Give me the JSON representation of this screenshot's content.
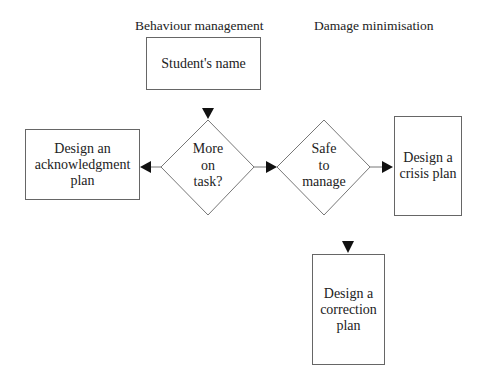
{
  "headings": {
    "left": "Behaviour management",
    "right": "Damage minimisation"
  },
  "nodes": {
    "start": "Student's name",
    "decision_on_task": "More\non\ntask?",
    "decision_safe": "Safe\nto\nmanage",
    "acknowledgment": "Design an\nacknowledgment\nplan",
    "crisis": "Design a\ncrisis plan",
    "correction": "Design a\ncorrection\nplan"
  },
  "edges": [
    {
      "from": "start",
      "to": "decision_on_task"
    },
    {
      "from": "decision_on_task",
      "to": "acknowledgment"
    },
    {
      "from": "decision_on_task",
      "to": "decision_safe"
    },
    {
      "from": "decision_safe",
      "to": "crisis"
    },
    {
      "from": "decision_safe",
      "to": "correction"
    }
  ],
  "colors": {
    "line": "#777777",
    "arrow": "#111111",
    "text": "#222222"
  }
}
